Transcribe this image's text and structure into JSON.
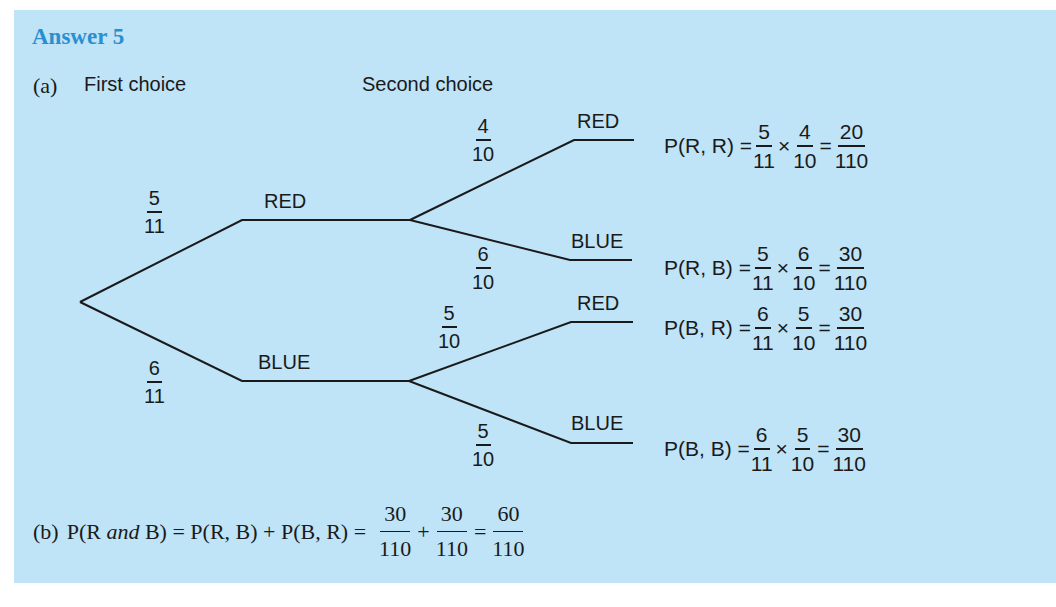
{
  "title": "Answer 5",
  "part_a": {
    "label": "(a)",
    "first_choice_header": "First choice",
    "second_choice_header": "Second choice"
  },
  "tree": {
    "first": [
      {
        "outcome": "RED",
        "prob": {
          "num": "5",
          "den": "11"
        }
      },
      {
        "outcome": "BLUE",
        "prob": {
          "num": "6",
          "den": "11"
        }
      }
    ],
    "second": [
      {
        "parent": "RED",
        "outcome": "RED",
        "prob": {
          "num": "4",
          "den": "10"
        }
      },
      {
        "parent": "RED",
        "outcome": "BLUE",
        "prob": {
          "num": "6",
          "den": "10"
        }
      },
      {
        "parent": "BLUE",
        "outcome": "RED",
        "prob": {
          "num": "5",
          "den": "10"
        }
      },
      {
        "parent": "BLUE",
        "outcome": "BLUE",
        "prob": {
          "num": "5",
          "den": "10"
        }
      }
    ],
    "results": [
      {
        "label": "P(R, R) =",
        "f1": {
          "num": "5",
          "den": "11"
        },
        "times": "×",
        "f2": {
          "num": "4",
          "den": "10"
        },
        "equals": "=",
        "res": {
          "num": "20",
          "den": "110"
        }
      },
      {
        "label": "P(R, B) =",
        "f1": {
          "num": "5",
          "den": "11"
        },
        "times": "×",
        "f2": {
          "num": "6",
          "den": "10"
        },
        "equals": "=",
        "res": {
          "num": "30",
          "den": "110"
        }
      },
      {
        "label": "P(B, R) =",
        "f1": {
          "num": "6",
          "den": "11"
        },
        "times": "×",
        "f2": {
          "num": "5",
          "den": "10"
        },
        "equals": "=",
        "res": {
          "num": "30",
          "den": "110"
        }
      },
      {
        "label": "P(B, B) =",
        "f1": {
          "num": "6",
          "den": "11"
        },
        "times": "×",
        "f2": {
          "num": "5",
          "den": "10"
        },
        "equals": "=",
        "res": {
          "num": "30",
          "den": "110"
        }
      }
    ]
  },
  "part_b": {
    "label": "(b)",
    "lhs_prefix": "P(R ",
    "lhs_italic": "and",
    "lhs_suffix": " B) = P(R, B) + P(B, R) =",
    "f1": {
      "num": "30",
      "den": "110"
    },
    "plus": "+",
    "f2": {
      "num": "30",
      "den": "110"
    },
    "equals": "=",
    "res": {
      "num": "60",
      "den": "110"
    }
  },
  "colors": {
    "background": "#bfe3f7",
    "title": "#2a8fd0",
    "ink": "#1a1a1a"
  }
}
